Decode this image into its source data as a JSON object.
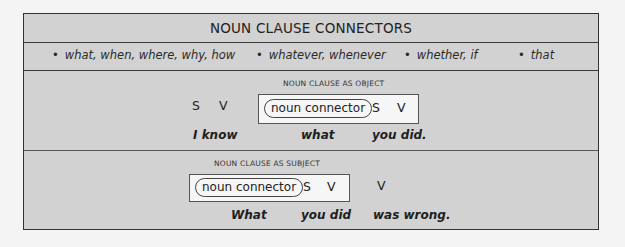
{
  "title": "NOUN CLAUSE CONNECTORS",
  "connectors": [
    {
      "bullet": "•",
      "text": "what, when, where, why, how"
    },
    {
      "bullet": "•",
      "text": "whatever, whenever"
    },
    {
      "bullet": "•",
      "text": "whether, if"
    },
    {
      "bullet": "•",
      "text": "that"
    }
  ],
  "object_section": {
    "label": "NOUN CLAUSE AS OBJECT",
    "main_s": "S",
    "main_v": "V",
    "connector_pill": "noun connector",
    "clause_s": "S",
    "clause_v": "V",
    "example": {
      "part1": "I know",
      "part2": "what",
      "part3": "you did."
    }
  },
  "subject_section": {
    "label": "NOUN CLAUSE AS SUBJECT",
    "connector_pill": "noun connector",
    "clause_s": "S",
    "clause_v": "V",
    "main_v": "V",
    "example": {
      "part1": "What",
      "part2": "you did",
      "part3": "was wrong."
    }
  },
  "colors": {
    "background": "#d2d2d2",
    "box_fill": "#f6f6f6",
    "border": "#333333",
    "page": "#f4f4f4"
  }
}
